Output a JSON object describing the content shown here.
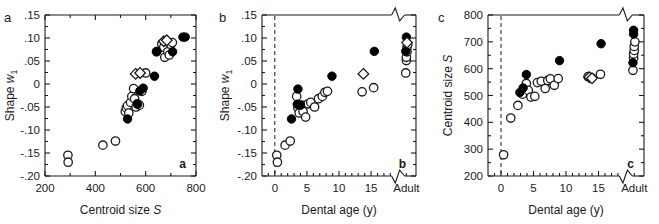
{
  "figure": {
    "background": "#ffffff",
    "ink": "#1a1a1a",
    "marker_fill_open": "#ffffff",
    "marker_fill_closed": "#000000"
  },
  "chart_data": [
    {
      "type": "scatter",
      "panel": "a",
      "panel_letter": "a",
      "panel_tag": "a",
      "title": "",
      "xlabel": "Centroid size S",
      "xlabel_main": "Centroid size",
      "xlabel_italic": "S",
      "ylabel": "Shape w1",
      "ylabel_main": "Shape",
      "ylabel_italic": "w",
      "ylabel_sub": "1",
      "xlim": [
        200,
        800
      ],
      "ylim": [
        -0.2,
        0.15
      ],
      "xticks": [
        200,
        400,
        600,
        800
      ],
      "xticklabels": [
        "200",
        "400",
        "600",
        "800"
      ],
      "xminorticks": [
        300,
        500,
        700
      ],
      "yticks": [
        -0.2,
        -0.15,
        -0.1,
        -0.05,
        0,
        0.05,
        0.1,
        0.15
      ],
      "yticklabels": [
        "-.20",
        "-.15",
        "-.10",
        "-.05",
        "0",
        ".05",
        ".10",
        ".15"
      ],
      "grid": false,
      "legend": "none",
      "axis_break": false,
      "reference_line": null,
      "series": [
        {
          "name": "open-circle",
          "marker": "circle-open",
          "points": [
            [
              291,
              -0.155
            ],
            [
              292,
              -0.17
            ],
            [
              430,
              -0.133
            ],
            [
              480,
              -0.124
            ],
            [
              519,
              -0.06
            ],
            [
              523,
              -0.052
            ],
            [
              528,
              -0.047
            ],
            [
              533,
              -0.063
            ],
            [
              540,
              -0.04
            ],
            [
              545,
              -0.027
            ],
            [
              552,
              -0.01
            ],
            [
              556,
              -0.032
            ],
            [
              562,
              -0.05
            ],
            [
              567,
              -0.043
            ],
            [
              575,
              -0.046
            ],
            [
              585,
              -0.016
            ],
            [
              600,
              0.024
            ],
            [
              643,
              0.07
            ],
            [
              664,
              0.087
            ],
            [
              672,
              0.08
            ],
            [
              676,
              0.058
            ],
            [
              683,
              0.092
            ],
            [
              688,
              0.07
            ],
            [
              694,
              0.063
            ],
            [
              700,
              0.086
            ],
            [
              706,
              0.09
            ]
          ]
        },
        {
          "name": "filled-circle",
          "marker": "circle-filled",
          "points": [
            [
              528,
              -0.076
            ],
            [
              568,
              -0.044
            ],
            [
              577,
              -0.015
            ],
            [
              590,
              -0.009
            ],
            [
              635,
              0.017
            ],
            [
              645,
              0.071
            ],
            [
              707,
              0.07
            ],
            [
              748,
              0.102
            ],
            [
              757,
              0.102
            ]
          ]
        },
        {
          "name": "open-diamond",
          "marker": "diamond-open",
          "points": [
            [
              560,
              0.022
            ],
            [
              578,
              0.024
            ],
            [
              672,
              0.093
            ],
            [
              684,
              0.095
            ]
          ]
        }
      ]
    },
    {
      "type": "scatter",
      "panel": "b",
      "panel_letter": "b",
      "panel_tag": "b",
      "title": "",
      "xlabel": "Dental age (y)",
      "ylabel": "Shape w1",
      "ylabel_main": "Shape",
      "ylabel_italic": "w",
      "ylabel_sub": "1",
      "xlim": [
        -2,
        22
      ],
      "ylim": [
        -0.2,
        0.15
      ],
      "xticks": [
        0,
        5,
        10,
        15
      ],
      "xticklabels": [
        "0",
        "5",
        "10",
        "15",
        "Adult"
      ],
      "adult_category": "Adult",
      "yticks": [
        -0.2,
        -0.15,
        -0.1,
        -0.05,
        0,
        0.05,
        0.1,
        0.15
      ],
      "yticklabels": [
        "-.20",
        "-.15",
        "-.10",
        "-.05",
        "0",
        ".05",
        ".10",
        ".15"
      ],
      "grid": false,
      "legend": "none",
      "axis_break": true,
      "axis_break_note": "zigzag break in top and bottom axis before Adult",
      "reference_line": {
        "x": 0,
        "style": "dashed"
      },
      "series": [
        {
          "name": "open-circle",
          "marker": "circle-open",
          "points": [
            [
              0.3,
              -0.155
            ],
            [
              0.4,
              -0.17
            ],
            [
              1.6,
              -0.133
            ],
            [
              2.4,
              -0.124
            ],
            [
              3.4,
              -0.027
            ],
            [
              3.6,
              -0.052
            ],
            [
              3.8,
              -0.063
            ],
            [
              4.2,
              -0.046
            ],
            [
              4.4,
              -0.06
            ],
            [
              4.8,
              -0.072
            ],
            [
              5.2,
              -0.043
            ],
            [
              5.6,
              -0.04
            ],
            [
              6.2,
              -0.05
            ],
            [
              6.8,
              -0.032
            ],
            [
              7.4,
              -0.027
            ],
            [
              7.8,
              -0.018
            ],
            [
              8.2,
              -0.016
            ],
            [
              13.6,
              -0.017
            ],
            [
              15.4,
              -0.008
            ],
            [
              20.4,
              0.024
            ],
            [
              20.5,
              0.051
            ],
            [
              20.5,
              0.058
            ],
            [
              20.6,
              0.07
            ],
            [
              20.6,
              0.08
            ],
            [
              20.7,
              0.086
            ]
          ]
        },
        {
          "name": "filled-circle",
          "marker": "circle-filled",
          "points": [
            [
              2.6,
              -0.076
            ],
            [
              3.5,
              -0.044
            ],
            [
              3.6,
              -0.011
            ],
            [
              4.0,
              -0.046
            ],
            [
              8.9,
              0.017
            ],
            [
              15.5,
              0.071
            ],
            [
              20.4,
              0.071
            ],
            [
              20.5,
              0.102
            ]
          ]
        },
        {
          "name": "open-diamond",
          "marker": "diamond-open",
          "points": [
            [
              13.8,
              0.022
            ],
            [
              20.6,
              0.09
            ]
          ]
        }
      ]
    },
    {
      "type": "scatter",
      "panel": "c",
      "panel_letter": "c",
      "panel_tag": "c",
      "title": "",
      "xlabel": "Dental age (y)",
      "ylabel": "Centroid size S",
      "ylabel_main": "Centroid size",
      "ylabel_italic": "S",
      "xlim": [
        -2,
        22
      ],
      "ylim": [
        200,
        800
      ],
      "xticks": [
        0,
        5,
        10,
        15
      ],
      "xticklabels": [
        "0",
        "5",
        "10",
        "15",
        "Adult"
      ],
      "adult_category": "Adult",
      "yticks": [
        200,
        300,
        400,
        500,
        600,
        700,
        800
      ],
      "yticklabels": [
        "200",
        "300",
        "400",
        "500",
        "600",
        "700",
        "800"
      ],
      "grid": false,
      "legend": "none",
      "axis_break": true,
      "axis_break_note": "zigzag break in top and bottom axis before Adult",
      "reference_line": {
        "x": 0,
        "style": "dashed"
      },
      "series": [
        {
          "name": "open-circle",
          "marker": "circle-open",
          "points": [
            [
              0.4,
              279
            ],
            [
              1.5,
              416
            ],
            [
              2.6,
              463
            ],
            [
              3.3,
              505
            ],
            [
              3.9,
              545
            ],
            [
              4.2,
              519
            ],
            [
              4.6,
              494
            ],
            [
              5.2,
              497
            ],
            [
              5.6,
              548
            ],
            [
              6.2,
              553
            ],
            [
              6.8,
              526
            ],
            [
              7.2,
              556
            ],
            [
              7.6,
              562
            ],
            [
              8.2,
              538
            ],
            [
              8.8,
              563
            ],
            [
              13.4,
              570
            ],
            [
              13.9,
              566
            ],
            [
              15.3,
              579
            ],
            [
              20.3,
              594
            ],
            [
              20.4,
              640
            ],
            [
              20.4,
              655
            ],
            [
              20.5,
              668
            ],
            [
              20.5,
              683
            ],
            [
              20.6,
              700
            ]
          ]
        },
        {
          "name": "filled-circle",
          "marker": "circle-filled",
          "points": [
            [
              2.9,
              511
            ],
            [
              3.4,
              528
            ],
            [
              3.9,
              578
            ],
            [
              9.0,
              630
            ],
            [
              15.4,
              693
            ],
            [
              20.3,
              622
            ],
            [
              20.4,
              729
            ],
            [
              20.4,
              743
            ]
          ]
        },
        {
          "name": "open-diamond",
          "marker": "diamond-open",
          "points": [
            [
              13.6,
              568
            ],
            [
              14.0,
              564
            ]
          ]
        }
      ]
    }
  ]
}
